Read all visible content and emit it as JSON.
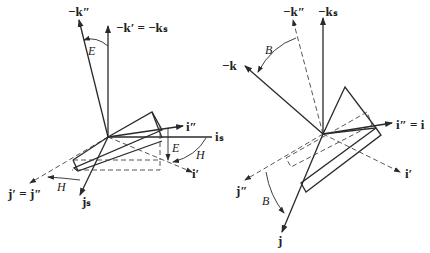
{
  "figure_left": {
    "labels": {
      "neg_k_dd": "−k″",
      "neg_k_prime": "−k′ = −kₛ",
      "i_dd": "i″",
      "i_s": "iₛ",
      "i_prime": "i′",
      "j_prime": "j′ = j″",
      "j_s": "jₛ",
      "angle_E_top": "E",
      "angle_E_side": "E",
      "angle_H_right": "H",
      "angle_H_left": "H"
    }
  },
  "figure_right": {
    "labels": {
      "neg_k_dd": "−k″",
      "neg_k_s": "−kₛ",
      "neg_k": "−k",
      "i_dd_eq_i": "i″ = i",
      "i_prime": "i′",
      "j_dd": "j″",
      "j": "j",
      "angle_B_top": "B",
      "angle_B_bottom": "B"
    }
  }
}
